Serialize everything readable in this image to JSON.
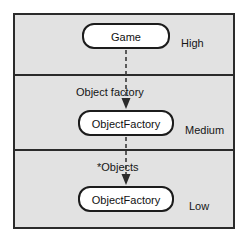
{
  "diagram": {
    "type": "layered-architecture",
    "title": "",
    "colors": {
      "layer_background": "#e2e2e2",
      "border": "#2b2b2b",
      "node_fill": "#ffffff",
      "node_border": "#1c1c1c",
      "text": "#111111",
      "connector": "#3a3a3a",
      "page_background": "#ffffff"
    },
    "layers": [
      {
        "id": "high",
        "tier_label": "High",
        "node_label": "Game"
      },
      {
        "id": "medium",
        "tier_label": "Medium",
        "node_label": "ObjectFactory",
        "incoming_edge_label": "Object factory"
      },
      {
        "id": "low",
        "tier_label": "Low",
        "node_label": "ObjectFactory",
        "incoming_edge_label": "*Objects"
      }
    ],
    "connectors": [
      {
        "id": "game-to-factory",
        "from": "Game",
        "to": "ObjectFactory",
        "label": "Object factory",
        "style": "dashed",
        "arrowhead": "solid-triangle"
      },
      {
        "id": "factory-to-factory",
        "from": "ObjectFactory",
        "to": "ObjectFactory",
        "label": "*Objects",
        "style": "dashed",
        "arrowhead": "solid-triangle"
      }
    ]
  }
}
